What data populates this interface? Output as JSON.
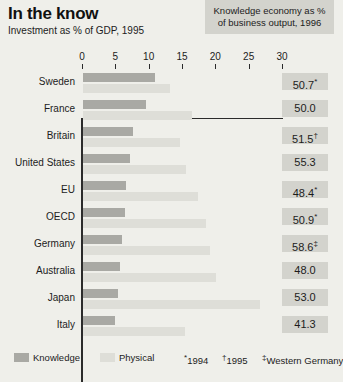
{
  "header": {
    "title": "In the know",
    "subtitle": "Investment as % of GDP, 1995",
    "box_line1": "Knowledge economy as %",
    "box_line2": "of business output, 1996"
  },
  "legend": {
    "knowledge_label": "Knowledge",
    "physical_label": "Physical",
    "footnote1": "1994",
    "footnote1_mark": "*",
    "footnote2": "1995",
    "footnote2_mark": "†",
    "footnote3": "Western Germany",
    "footnote3_mark": "‡"
  },
  "chart_data": {
    "type": "bar",
    "title": "In the know",
    "subtitle": "Investment as % of GDP, 1995",
    "orientation": "horizontal",
    "xlabel": "",
    "ylabel": "",
    "xlim": [
      0,
      30
    ],
    "xticks": [
      0,
      5,
      10,
      15,
      20,
      25,
      30
    ],
    "grid": false,
    "legend_position": "bottom-left",
    "categories": [
      "Sweden",
      "France",
      "Britain",
      "United States",
      "EU",
      "OECD",
      "Germany",
      "Australia",
      "Japan",
      "Italy"
    ],
    "series": [
      {
        "name": "Knowledge",
        "color": "#a9a9a4",
        "values": [
          10.8,
          9.5,
          7.5,
          7.0,
          6.5,
          6.3,
          5.8,
          5.5,
          5.3,
          4.8
        ]
      },
      {
        "name": "Physical",
        "color": "#dedeD8",
        "values": [
          13.0,
          16.3,
          14.5,
          15.5,
          17.3,
          18.5,
          19.0,
          20.0,
          26.5,
          15.3
        ]
      }
    ],
    "side_column": {
      "header": "Knowledge economy as % of business output, 1996",
      "values": [
        "50.7",
        "50.0",
        "51.5",
        "55.3",
        "48.4",
        "50.9",
        "58.6",
        "48.0",
        "53.0",
        "41.3"
      ],
      "marks": [
        "*",
        "",
        "†",
        "",
        "*",
        "*",
        "‡",
        "",
        "",
        ""
      ]
    }
  }
}
